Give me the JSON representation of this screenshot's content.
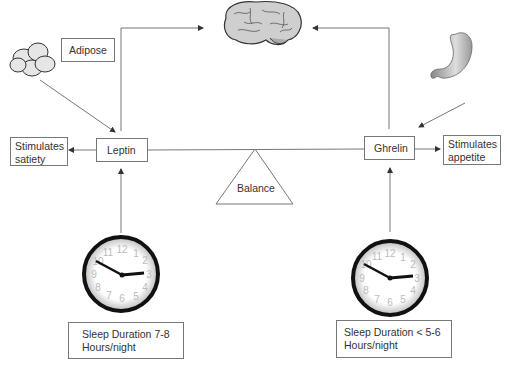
{
  "diagram": {
    "nodes": {
      "adipose": {
        "label": "Adipose"
      },
      "leptin": {
        "label": "Leptin"
      },
      "ghrelin": {
        "label": "Ghrelin"
      },
      "satiety": {
        "line1": "Stimulates",
        "line2": "satiety"
      },
      "appetite": {
        "line1": "Stimulates",
        "line2": "appetite"
      },
      "balance": {
        "label": "Balance"
      },
      "sleep_left": {
        "line1": "Sleep Duration 7-8",
        "line2": "Hours/night"
      },
      "sleep_right": {
        "line1": "Sleep Duration < 5-6",
        "line2": "Hours/night"
      }
    },
    "icons": [
      "adipose-cells-icon",
      "brain-icon",
      "stomach-icon",
      "clock-icon",
      "clock-icon"
    ],
    "clock_numbers": [
      "12",
      "1",
      "2",
      "3",
      "4",
      "5",
      "6",
      "7",
      "8",
      "9",
      "10",
      "11"
    ],
    "colors": {
      "line": "#777777",
      "text": "#333333",
      "clock_rim": "#111111"
    }
  }
}
